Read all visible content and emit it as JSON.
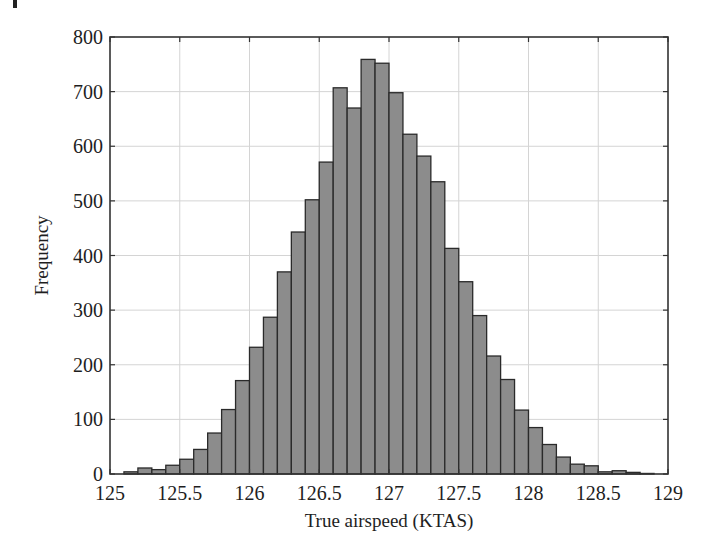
{
  "chart_data": {
    "type": "bar",
    "subtype": "histogram",
    "title": "",
    "xlabel": "True airspeed  (KTAS)",
    "ylabel": "Frequency",
    "xlim": [
      125,
      129
    ],
    "ylim": [
      0,
      800
    ],
    "xticks": [
      125,
      125.5,
      126,
      126.5,
      127,
      127.5,
      128,
      128.5,
      129
    ],
    "xtick_labels": [
      "125",
      "125.5",
      "126",
      "126.5",
      "127",
      "127.5",
      "128",
      "128.5",
      "129"
    ],
    "yticks": [
      0,
      100,
      200,
      300,
      400,
      500,
      600,
      700,
      800
    ],
    "ytick_labels": [
      "0",
      "100",
      "200",
      "300",
      "400",
      "500",
      "600",
      "700",
      "800"
    ],
    "grid": true,
    "legend": null,
    "bin_width": 0.1,
    "bin_starts": [
      125.1,
      125.2,
      125.3,
      125.4,
      125.5,
      125.6,
      125.7,
      125.8,
      125.9,
      126.0,
      126.1,
      126.2,
      126.3,
      126.4,
      126.5,
      126.6,
      126.7,
      126.8,
      126.9,
      127.0,
      127.1,
      127.2,
      127.3,
      127.4,
      127.5,
      127.6,
      127.7,
      127.8,
      127.9,
      128.0,
      128.1,
      128.2,
      128.3,
      128.4,
      128.5,
      128.6,
      128.7,
      128.8
    ],
    "values": [
      4,
      11,
      8,
      16,
      27,
      45,
      75,
      118,
      171,
      232,
      287,
      370,
      443,
      502,
      571,
      707,
      670,
      759,
      752,
      698,
      622,
      582,
      535,
      413,
      352,
      290,
      216,
      173,
      117,
      85,
      54,
      31,
      18,
      15,
      4,
      6,
      3,
      1
    ],
    "colors": {
      "bar_fill": "#8c8c8c",
      "bar_edge": "#2a2a2a",
      "grid": "#d4d4d4",
      "axes": "#333333"
    }
  }
}
